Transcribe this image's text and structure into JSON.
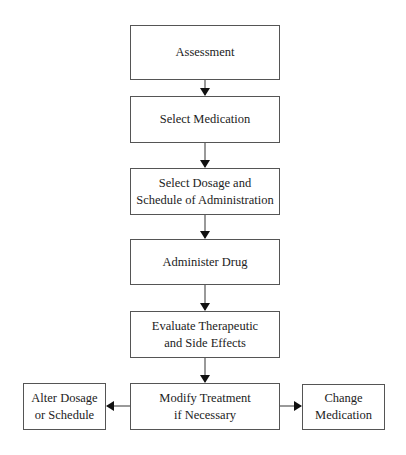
{
  "diagram": {
    "type": "flowchart",
    "direction": "top-to-bottom",
    "nodes": [
      {
        "id": "assessment",
        "lines": [
          "Assessment"
        ]
      },
      {
        "id": "select-medication",
        "lines": [
          "Select Medication"
        ]
      },
      {
        "id": "select-dosage",
        "lines": [
          "Select Dosage and",
          "Schedule of Administration"
        ]
      },
      {
        "id": "administer-drug",
        "lines": [
          "Administer Drug"
        ]
      },
      {
        "id": "evaluate-effects",
        "lines": [
          "Evaluate Therapeutic",
          "and Side Effects"
        ]
      },
      {
        "id": "modify-treatment",
        "lines": [
          "Modify Treatment",
          "if Necessary"
        ]
      },
      {
        "id": "alter-dosage",
        "lines": [
          "Alter Dosage",
          "or Schedule"
        ]
      },
      {
        "id": "change-medication",
        "lines": [
          "Change",
          "Medication"
        ]
      }
    ],
    "edges": [
      {
        "from": "assessment",
        "to": "select-medication"
      },
      {
        "from": "select-medication",
        "to": "select-dosage"
      },
      {
        "from": "select-dosage",
        "to": "administer-drug"
      },
      {
        "from": "administer-drug",
        "to": "evaluate-effects"
      },
      {
        "from": "evaluate-effects",
        "to": "modify-treatment"
      },
      {
        "from": "modify-treatment",
        "to": "alter-dosage"
      },
      {
        "from": "modify-treatment",
        "to": "change-medication"
      }
    ],
    "colors": {
      "border": "#555555",
      "arrow": "#111111",
      "text": "#222222",
      "background": "#ffffff"
    }
  }
}
